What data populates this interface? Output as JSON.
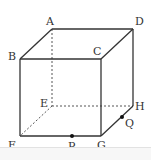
{
  "diagram": {
    "type": "cube",
    "vertices": {
      "A": {
        "label": "A",
        "x": 52,
        "y": 29
      },
      "B": {
        "label": "B",
        "x": 20,
        "y": 59
      },
      "C": {
        "label": "C",
        "x": 101,
        "y": 59
      },
      "D": {
        "label": "D",
        "x": 133,
        "y": 29
      },
      "E": {
        "label": "E",
        "x": 52,
        "y": 106
      },
      "F": {
        "label": "F",
        "x": 20,
        "y": 136
      },
      "G": {
        "label": "G",
        "x": 101,
        "y": 136
      },
      "H": {
        "label": "H",
        "x": 133,
        "y": 106
      }
    },
    "points": {
      "P": {
        "label": "P",
        "on_edge": "FG",
        "x": 72,
        "y": 136
      },
      "Q": {
        "label": "Q",
        "on_edge": "GH",
        "x": 122,
        "y": 117
      }
    },
    "visible_edges": [
      "AB",
      "AD",
      "BC",
      "CD",
      "BF",
      "CG",
      "DH",
      "FG",
      "GH"
    ],
    "hidden_edges": [
      "AE",
      "EF",
      "EH"
    ],
    "colors": {
      "line": "#333333",
      "point": "#111111",
      "background": "#ffffff"
    }
  }
}
